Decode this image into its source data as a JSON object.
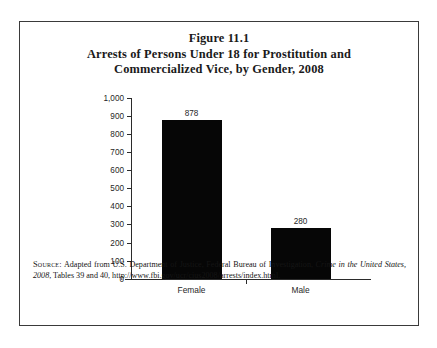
{
  "figure": {
    "title_lines": [
      "Figure 11.1",
      "Arrests of Persons Under 18 for Prostitution and",
      "Commercialized Vice, by Gender, 2008"
    ],
    "source": {
      "label": "Source:",
      "text_before_italic": " Adapted from U.S. Department of Justice, Federal Bureau of Investigation, ",
      "italic_title": "Crime in the United States, 2008",
      "text_after_italic": ", Tables 39 and 40, http://www.fbi.gov/ucr/cius2008/arrests/index.html."
    }
  },
  "chart_data": {
    "type": "bar",
    "title": "Arrests of Persons Under 18 for Prostitution and Commercialized Vice, by Gender, 2008",
    "categories": [
      "Female",
      "Male"
    ],
    "values": [
      878,
      280
    ],
    "xlabel": "",
    "ylabel": "",
    "ylim": [
      0,
      1000
    ],
    "yticks": [
      0,
      100,
      200,
      300,
      400,
      500,
      600,
      700,
      800,
      900,
      1000
    ],
    "ytick_labels": [
      "0",
      "100",
      "200",
      "300",
      "400",
      "500",
      "600",
      "700",
      "800",
      "900",
      "1,000"
    ],
    "grid": false,
    "legend": null,
    "bar_color": "#060606",
    "data_labels": [
      "878",
      "280"
    ]
  }
}
